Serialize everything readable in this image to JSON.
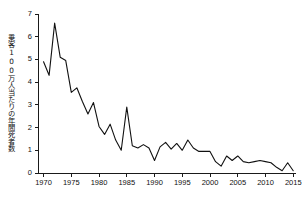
{
  "chart_data": {
    "type": "line",
    "title": "",
    "subtitle": "",
    "xlabel": "",
    "ylabel": "乗客100万人当たりの年間死者数",
    "xlim": [
      1969,
      2015.5
    ],
    "ylim": [
      0,
      7
    ],
    "grid": false,
    "legend": null,
    "line_color": "#111111",
    "axis_color": "#1a1a1a",
    "x": [
      1970,
      1971,
      1972,
      1973,
      1974,
      1975,
      1976,
      1977,
      1978,
      1979,
      1980,
      1981,
      1982,
      1983,
      1984,
      1985,
      1986,
      1987,
      1988,
      1989,
      1990,
      1991,
      1992,
      1993,
      1994,
      1995,
      1996,
      1997,
      1998,
      1999,
      2000,
      2001,
      2002,
      2003,
      2004,
      2005,
      2006,
      2007,
      2008,
      2009,
      2010,
      2011,
      2012,
      2013,
      2014,
      2015
    ],
    "values": [
      4.9,
      4.3,
      6.6,
      5.1,
      4.95,
      3.55,
      3.75,
      3.15,
      2.6,
      3.1,
      2.05,
      1.7,
      2.15,
      1.45,
      1.0,
      2.9,
      1.2,
      1.1,
      1.25,
      1.1,
      0.55,
      1.15,
      1.35,
      1.05,
      1.3,
      1.0,
      1.45,
      1.1,
      0.95,
      0.95,
      0.95,
      0.5,
      0.3,
      0.75,
      0.55,
      0.75,
      0.5,
      0.45,
      0.5,
      0.55,
      0.5,
      0.45,
      0.25,
      0.1,
      0.45,
      0.1
    ],
    "series": [
      {
        "name": "乗客100万人当たりの年間死者数",
        "values": [
          4.9,
          4.3,
          6.6,
          5.1,
          4.95,
          3.55,
          3.75,
          3.15,
          2.6,
          3.1,
          2.05,
          1.7,
          2.15,
          1.45,
          1.0,
          2.9,
          1.2,
          1.1,
          1.25,
          1.1,
          0.55,
          1.15,
          1.35,
          1.05,
          1.3,
          1.0,
          1.45,
          1.1,
          0.95,
          0.95,
          0.95,
          0.5,
          0.3,
          0.75,
          0.55,
          0.75,
          0.5,
          0.45,
          0.5,
          0.55,
          0.5,
          0.45,
          0.25,
          0.1,
          0.45,
          0.1
        ]
      }
    ],
    "ytick_values": [
      0,
      1,
      2,
      3,
      4,
      5,
      6,
      7
    ],
    "ytick_labels": [
      "0",
      "1",
      "2",
      "3",
      "4",
      "5",
      "6",
      "7"
    ],
    "xtick_values": [
      1970,
      1975,
      1980,
      1985,
      1990,
      1995,
      2000,
      2005,
      2010,
      2015
    ],
    "xtick_labels": [
      "1970",
      "1975",
      "1980",
      "1985",
      "1990",
      "1995",
      "2000",
      "2005",
      "2010",
      "2015"
    ]
  }
}
